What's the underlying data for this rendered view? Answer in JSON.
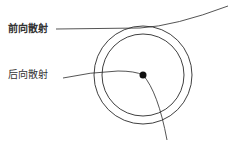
{
  "diagram": {
    "type": "scattering-schematic",
    "labels": {
      "forward": "前向散射",
      "backward": "后向散射"
    },
    "colors": {
      "line": "#2a2a2a",
      "particle": "#111111",
      "background": "#ffffff",
      "text": "#333333"
    },
    "elements": {
      "outer_circle": {
        "cx": 143,
        "cy": 75,
        "r": 49
      },
      "inner_circle": {
        "cx": 143,
        "cy": 75,
        "r": 41
      },
      "particle": {
        "cx": 143,
        "cy": 75,
        "r": 3.5
      }
    }
  }
}
